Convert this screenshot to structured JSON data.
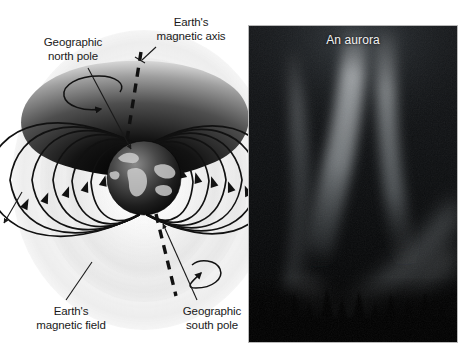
{
  "figure": {
    "background_color": "#ffffff",
    "width": 467,
    "height": 359
  },
  "diagram": {
    "name": "earth-magnetic-field-diagram",
    "labels": {
      "geographic_north_pole": {
        "line1": "Geographic",
        "line2": "north pole"
      },
      "earths_magnetic_axis": {
        "line1": "Earth's",
        "line2": "magnetic axis"
      },
      "earths_magnetic_field": {
        "line1": "Earth's",
        "line2": "magnetic field"
      },
      "geographic_south_pole": {
        "line1": "Geographic",
        "line2": "south pole"
      }
    },
    "elements": {
      "globe": "earth-globe",
      "field_lines": "magnetic-field-lines",
      "magnetic_axis": "dashed-magnetic-axis-line",
      "rotation_arrow_north": "north-rotation-arrow",
      "rotation_arrow_south": "south-rotation-arrow"
    },
    "colors": {
      "line": "#111111",
      "text": "#1a1a1a",
      "background": "#ffffff"
    }
  },
  "photo": {
    "name": "aurora-photograph",
    "title": "An aurora",
    "title_color": "#f2f2f2",
    "frame_color": "#b9b9b9",
    "background_color": "#050505"
  }
}
